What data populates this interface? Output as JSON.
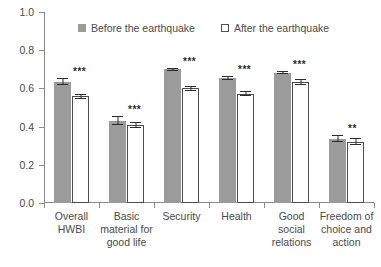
{
  "chart_data": {
    "type": "bar",
    "title": "",
    "xlabel": "",
    "ylabel": "",
    "ylim": [
      0.0,
      1.0
    ],
    "ytick_labels": [
      "0.0",
      "0.2",
      "0.4",
      "0.6",
      "0.8",
      "1.0"
    ],
    "ytick_values": [
      0.0,
      0.2,
      0.4,
      0.6,
      0.8,
      1.0
    ],
    "grid": false,
    "legend_position": "top-center",
    "categories": [
      "Overall HWBI",
      "Basic material for good life",
      "Security",
      "Health",
      "Good social relations",
      "Freedom of choice and action"
    ],
    "category_lines": [
      [
        "Overall",
        "HWBI"
      ],
      [
        "Basic",
        "material for",
        "good life"
      ],
      [
        "Security"
      ],
      [
        "Health"
      ],
      [
        "Good social",
        "relations"
      ],
      [
        "Freedom of",
        "choice and",
        "action"
      ]
    ],
    "series": [
      {
        "name": "Before the earthquake",
        "color": "#9b9b9b",
        "values": [
          0.635,
          0.432,
          0.7,
          0.655,
          0.683,
          0.336
        ],
        "errors": [
          0.018,
          0.022,
          0.008,
          0.012,
          0.01,
          0.018
        ]
      },
      {
        "name": "After the earthquake",
        "color": "#ffffff",
        "values": [
          0.558,
          0.409,
          0.6,
          0.573,
          0.633,
          0.322
        ],
        "errors": [
          0.014,
          0.016,
          0.012,
          0.012,
          0.014,
          0.018
        ]
      }
    ],
    "annotations": [
      "***",
      "***",
      "***",
      "***",
      "***",
      "**"
    ]
  },
  "legend": {
    "entries": [
      {
        "label": "Before the earthquake",
        "swatch": "filled-square"
      },
      {
        "label": "After the earthquake",
        "swatch": "hollow-square"
      }
    ]
  },
  "colors": {
    "before_bar": "#9b9b9b",
    "after_bar": "#ffffff",
    "after_bar_border": "#4d4d4d",
    "axis": "#8a8a8a",
    "text": "#4a4a4a",
    "error_bar": "#2b2b2b"
  }
}
